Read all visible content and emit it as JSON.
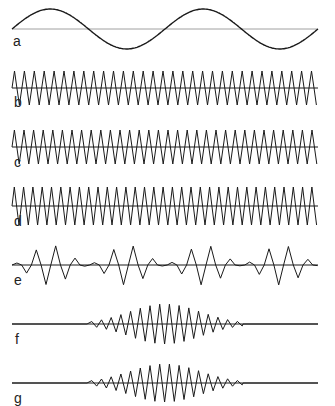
{
  "diagram": {
    "x_start": 12,
    "x_end": 318,
    "stroke_color": "#1a1a1a",
    "baseline_color": "#555555",
    "traces": [
      {
        "id": "a",
        "label": "a",
        "type": "sine",
        "baseline_y": 29,
        "amplitude": 20,
        "period": 153,
        "phase": 0,
        "label_x": 13,
        "label_y": 34
      },
      {
        "id": "b",
        "label": "b",
        "type": "triangle",
        "baseline_y": 88,
        "amplitude": 17,
        "period": 9.9,
        "phase": 0,
        "label_x": 14,
        "label_y": 95
      },
      {
        "id": "c",
        "label": "c",
        "type": "triangle",
        "baseline_y": 147,
        "amplitude": 17,
        "period": 9.6,
        "phase": 0,
        "label_x": 14,
        "label_y": 155
      },
      {
        "id": "d",
        "label": "d",
        "type": "triangle",
        "baseline_y": 206,
        "amplitude": 19,
        "period": 9.3,
        "phase": 0,
        "label_x": 14,
        "label_y": 214
      },
      {
        "id": "e",
        "label": "e",
        "type": "beats",
        "baseline_y": 265,
        "amplitude": 20,
        "period": 9.7,
        "beat_period": 77,
        "beat_phase": 50,
        "label_x": 14,
        "label_y": 273
      },
      {
        "id": "f",
        "label": "f",
        "type": "packet",
        "baseline_y": 324,
        "amplitude": 20,
        "period": 9.7,
        "center": 165,
        "halfwidth": 78,
        "label_x": 15,
        "label_y": 332
      },
      {
        "id": "g",
        "label": "g",
        "type": "packet",
        "baseline_y": 383,
        "amplitude": 19,
        "period": 9.7,
        "center": 165,
        "halfwidth": 78,
        "label_x": 14,
        "label_y": 391
      }
    ]
  }
}
